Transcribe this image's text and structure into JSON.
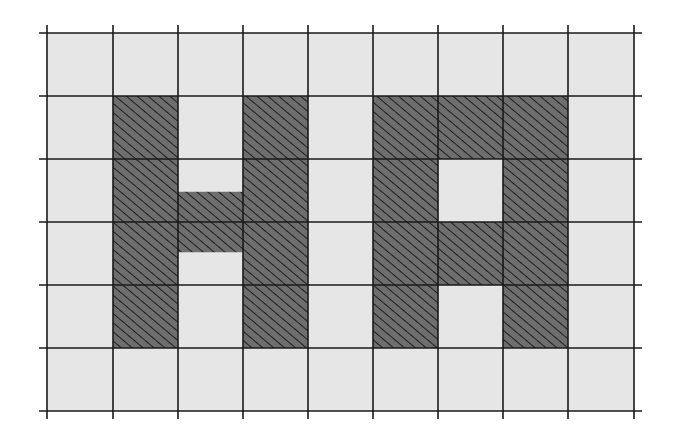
{
  "diagram": {
    "rows": 6,
    "cols": 9,
    "x_lines": [
      47,
      113,
      178,
      243,
      308,
      373,
      438,
      503,
      568,
      634
    ],
    "y_lines": [
      33,
      96,
      159,
      222,
      285,
      348,
      411
    ],
    "line_overhang": 8,
    "colors": {
      "background": "#ffffff",
      "light_cell": "#e6e6e6",
      "dark_cell": "#6e6e6e",
      "hatch": "#1e1e1e",
      "grid_line": "#1a1a1a"
    },
    "filled_cells": [
      [
        1,
        1
      ],
      [
        1,
        3
      ],
      [
        1,
        5
      ],
      [
        1,
        6
      ],
      [
        1,
        7
      ],
      [
        2,
        1
      ],
      [
        2,
        3
      ],
      [
        2,
        5
      ],
      [
        2,
        7
      ],
      [
        3,
        1
      ],
      [
        3,
        3
      ],
      [
        3,
        5
      ],
      [
        3,
        6
      ],
      [
        3,
        7
      ],
      [
        4,
        1
      ],
      [
        4,
        3
      ],
      [
        4,
        5
      ],
      [
        4,
        7
      ]
    ],
    "partial_fills": [
      {
        "row": 2,
        "col": 2,
        "from": 0.52,
        "to": 1.0
      },
      {
        "row": 3,
        "col": 2,
        "from": 0.0,
        "to": 0.48
      }
    ],
    "letters": [
      "H",
      "A"
    ]
  }
}
